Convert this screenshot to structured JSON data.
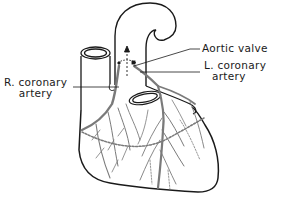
{
  "diagram": {
    "labels": {
      "aortic_valve": "Aortic valve",
      "l_coronary_line1": "L. coronary",
      "l_coronary_line2": "artery",
      "r_coronary_line1": "R. coronary",
      "r_coronary_line2": "artery"
    },
    "colors": {
      "outline": "#1a1a1a",
      "vessels": "#7a7a7a",
      "background": "#ffffff"
    }
  }
}
